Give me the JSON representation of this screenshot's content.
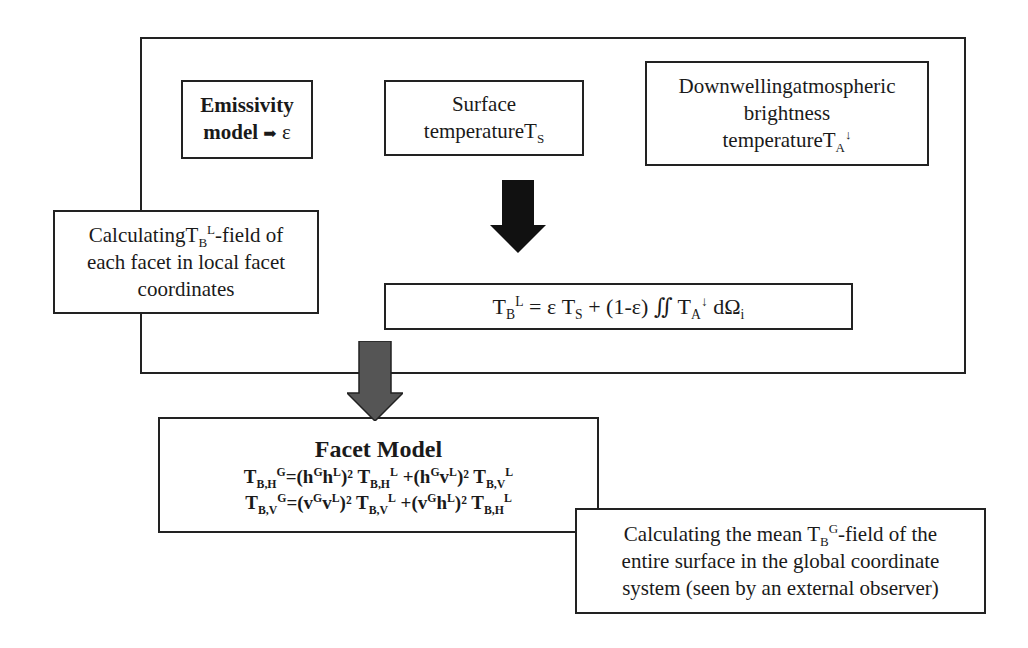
{
  "diagram": {
    "outer_frame": {
      "label": ""
    },
    "emissivity_box": {
      "line1": "Emissivity",
      "line2_text": "model",
      "line2_arrow_icon": "➡",
      "line2_symbol": "ε"
    },
    "surface_temperature_box": {
      "line1": "Surface",
      "line2_text": "temperature",
      "symbol_main": "T",
      "symbol_sub": "S"
    },
    "downwelling_box": {
      "line1": "Downwellingatmospheric",
      "line2": "brightness",
      "line3_text": "temperature",
      "symbol_main": "T",
      "symbol_sub": "A",
      "symbol_sup": "↓"
    },
    "local_callout": {
      "line1_pre": "Calculating",
      "line1_T": "T",
      "line1_sub": "B",
      "line1_sup": "L",
      "line1_post": "-field of",
      "line2": "each facet in local facet",
      "line3": "coordinates"
    },
    "local_equation": {
      "lhs_T": "T",
      "lhs_sub": "B",
      "lhs_sup": "L",
      "rhs_part1": " = ε T",
      "rhs_sub1": "S",
      "rhs_part2": " + (1-ε) ∬ T",
      "rhs_sub2": "A",
      "rhs_sup2": "↓",
      "rhs_part3": " dΩ",
      "rhs_sub3": "i"
    },
    "facet_model_box": {
      "title": "Facet Model",
      "eq1": {
        "lhs": "T",
        "lhs_sub": "B,H",
        "lhs_sup": "G",
        "t1": "=(h",
        "t1_sup_a": "G",
        "t1_b": "h",
        "t1_sup_b": "L",
        "t1_end": ")² T",
        "t1_sub": "B,H",
        "t1_sup": "L",
        "t2": " +(h",
        "t2_sup_a": "G",
        "t2_b": "v",
        "t2_sup_b": "L",
        "t2_end": ")² T",
        "t2_sub": "B,V",
        "t2_sup": "L"
      },
      "eq2": {
        "lhs": "T",
        "lhs_sub": "B,V",
        "lhs_sup": "G",
        "t1": "=(v",
        "t1_sup_a": "G",
        "t1_b": "v",
        "t1_sup_b": "L",
        "t1_end": ")² T",
        "t1_sub": "B,V",
        "t1_sup": "L",
        "t2": " +(v",
        "t2_sup_a": "G",
        "t2_b": "h",
        "t2_sup_b": "L",
        "t2_end": ")² T",
        "t2_sub": "B,H",
        "t2_sup": "L"
      }
    },
    "global_callout": {
      "line1_pre": "Calculating the mean ",
      "line1_T": "T",
      "line1_sub": "B",
      "line1_sup": "G",
      "line1_post": "-field of the",
      "line2": "entire surface in the global coordinate",
      "line3": "system (seen by an external observer)"
    },
    "arrows": {
      "black_arrow_color": "#111111",
      "grey_arrow_color": "#555555"
    }
  }
}
